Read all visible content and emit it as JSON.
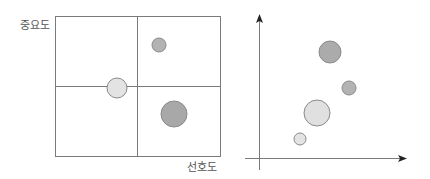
{
  "left_chart": {
    "y_label": "중요도",
    "x_label": "선호도",
    "box": {
      "x": 55,
      "y": 16,
      "w": 165,
      "h": 140
    },
    "divider_x": 137,
    "divider_y": 86,
    "bubbles": [
      {
        "cx": 159,
        "cy": 45,
        "r": 7,
        "fill": "#b3b3b3"
      },
      {
        "cx": 117,
        "cy": 88,
        "r": 10,
        "fill": "#e3e3e3"
      },
      {
        "cx": 174,
        "cy": 114,
        "r": 13,
        "fill": "#a8a8a8"
      }
    ]
  },
  "right_chart": {
    "axis_origin": {
      "x": 259,
      "y": 158
    },
    "y_axis_top": 14,
    "x_axis_right": 407,
    "bubbles": [
      {
        "cx": 330,
        "cy": 52,
        "r": 11,
        "fill": "#ababab"
      },
      {
        "cx": 349,
        "cy": 88,
        "r": 7,
        "fill": "#b3b3b3"
      },
      {
        "cx": 317,
        "cy": 113,
        "r": 13,
        "fill": "#e0e0e0"
      },
      {
        "cx": 300,
        "cy": 139,
        "r": 6,
        "fill": "#e3e3e3"
      }
    ]
  },
  "colors": {
    "line": "#7a7a7a",
    "stroke": "#8a8a8a",
    "text": "#555555"
  }
}
